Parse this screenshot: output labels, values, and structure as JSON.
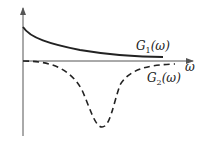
{
  "diagram": {
    "type": "line",
    "x_axis_label": "ω",
    "curves": [
      {
        "name": "G1",
        "label": "G",
        "subscript": "1",
        "arg": "(ω)",
        "style": "solid",
        "description": "monotonically decaying positive curve"
      },
      {
        "name": "G2",
        "label": "G",
        "subscript": "2",
        "arg": "(ω)",
        "style": "dashed",
        "description": "negative dip with minimum near middle"
      }
    ],
    "colors": {
      "line": "#222222",
      "axis": "#555555"
    }
  }
}
